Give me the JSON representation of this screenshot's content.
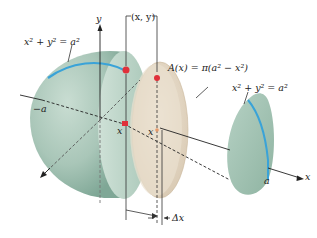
{
  "diagram": {
    "labels": {
      "y_axis": "y",
      "x_axis": "x",
      "point_xy": "(x, y)",
      "circle_eq_left": "x² + y² = a²",
      "circle_eq_right": "x² + y² = a²",
      "area_formula": "A(x) = π(a² − x²)",
      "neg_a": "−a",
      "pos_a": "a",
      "x_mark_left": "x",
      "x_mark_right": "x",
      "delta_x": "Δx"
    },
    "colors": {
      "sphere_fill": "#a9c6b8",
      "sphere_shade": "#7fa796",
      "slice_fill": "#e3d6c3",
      "circle_arc": "#3aa3d8",
      "point_marker": "#e0303a",
      "axis": "#222222"
    }
  }
}
